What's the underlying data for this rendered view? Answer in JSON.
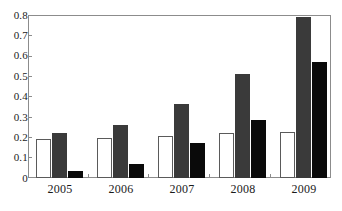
{
  "chart_data": {
    "type": "bar",
    "title": "",
    "subtitle": "",
    "xlabel": "",
    "ylabel": "",
    "categories": [
      "2005",
      "2006",
      "2007",
      "2008",
      "2009"
    ],
    "series": [
      {
        "name": "series-1",
        "color": "#ffffff",
        "style": "white-outlined",
        "values": [
          0.19,
          0.195,
          0.205,
          0.22,
          0.225
        ]
      },
      {
        "name": "series-2",
        "color": "#3a3a3a",
        "style": "dark-gray",
        "values": [
          0.22,
          0.26,
          0.365,
          0.51,
          0.79
        ]
      },
      {
        "name": "series-3",
        "color": "#0a0a0a",
        "style": "black",
        "values": [
          0.035,
          0.07,
          0.17,
          0.285,
          0.57
        ]
      }
    ],
    "ylim": [
      0,
      0.8
    ],
    "yticks": [
      "0",
      "0.1",
      "0.2",
      "0.3",
      "0.4",
      "0.5",
      "0.6",
      "0.7",
      "0.8"
    ],
    "ytick_values": [
      0,
      0.1,
      0.2,
      0.3,
      0.4,
      0.5,
      0.6,
      0.7,
      0.8
    ],
    "grid": false,
    "legend": null,
    "legend_position": "none",
    "frame": true,
    "annotations": []
  },
  "axis": {
    "y_label_0": "0",
    "y_label_1": "0.1",
    "y_label_2": "0.2",
    "y_label_3": "0.3",
    "y_label_4": "0.4",
    "y_label_5": "0.5",
    "y_label_6": "0.6",
    "y_label_7": "0.7",
    "y_label_8": "0.8",
    "x_label_0": "2005",
    "x_label_1": "2006",
    "x_label_2": "2007",
    "x_label_3": "2008",
    "x_label_4": "2009"
  },
  "colors": {
    "series_white": "#ffffff",
    "series_white_stroke": "#5a5a5a",
    "series_gray": "#3a3a3a",
    "series_black": "#0a0a0a",
    "frame": "#8c8c8c",
    "text": "#1a1a1a",
    "background": "#ffffff"
  }
}
